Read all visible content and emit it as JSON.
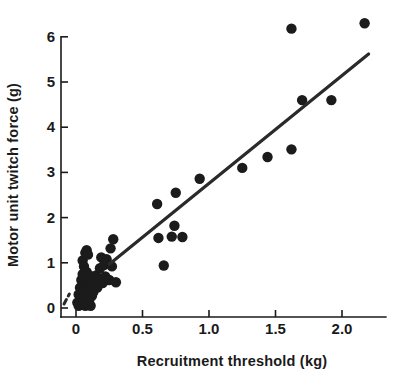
{
  "chart_data": {
    "type": "scatter",
    "title": "",
    "xlabel": "Recruitment threshold (kg)",
    "ylabel": "Motor unit twitch force (g)",
    "xlim": [
      -0.12,
      2.33
    ],
    "ylim": [
      -0.22,
      6.6
    ],
    "xticks": [
      0,
      0.5,
      1.0,
      1.5,
      2.0
    ],
    "xtick_labels": [
      "0",
      "0.5",
      "1.0",
      "1.5",
      "2.0"
    ],
    "yticks": [
      0,
      1,
      2,
      3,
      4,
      5,
      6
    ],
    "ytick_labels": [
      "0",
      "1",
      "2",
      "3",
      "4",
      "5",
      "6"
    ],
    "grid": false,
    "legend": null,
    "marker_color": "#1b1b1b",
    "marker_size": 5.2,
    "points": [
      [
        0.01,
        0.12
      ],
      [
        0.02,
        0.05
      ],
      [
        0.02,
        0.3
      ],
      [
        0.03,
        0.22
      ],
      [
        0.03,
        0.45
      ],
      [
        0.04,
        0.1
      ],
      [
        0.04,
        0.38
      ],
      [
        0.04,
        0.62
      ],
      [
        0.05,
        0.28
      ],
      [
        0.05,
        0.5
      ],
      [
        0.05,
        0.75
      ],
      [
        0.05,
        1.05
      ],
      [
        0.06,
        0.15
      ],
      [
        0.06,
        0.35
      ],
      [
        0.06,
        0.58
      ],
      [
        0.06,
        0.92
      ],
      [
        0.07,
        0.05
      ],
      [
        0.07,
        0.42
      ],
      [
        0.07,
        0.68
      ],
      [
        0.07,
        1.22
      ],
      [
        0.08,
        0.25
      ],
      [
        0.08,
        0.55
      ],
      [
        0.08,
        0.8
      ],
      [
        0.08,
        1.28
      ],
      [
        0.09,
        0.08
      ],
      [
        0.09,
        0.33
      ],
      [
        0.09,
        0.65
      ],
      [
        0.09,
        1.18
      ],
      [
        0.1,
        0.18
      ],
      [
        0.1,
        0.48
      ],
      [
        0.1,
        0.72
      ],
      [
        0.11,
        0.05
      ],
      [
        0.11,
        0.4
      ],
      [
        0.12,
        0.27
      ],
      [
        0.12,
        0.6
      ],
      [
        0.13,
        0.35
      ],
      [
        0.14,
        0.52
      ],
      [
        0.15,
        0.72
      ],
      [
        0.16,
        0.45
      ],
      [
        0.17,
        0.62
      ],
      [
        0.18,
        0.88
      ],
      [
        0.19,
        1.12
      ],
      [
        0.2,
        0.55
      ],
      [
        0.21,
        0.95
      ],
      [
        0.22,
        0.7
      ],
      [
        0.23,
        1.08
      ],
      [
        0.25,
        0.62
      ],
      [
        0.26,
        1.32
      ],
      [
        0.27,
        0.92
      ],
      [
        0.28,
        1.52
      ],
      [
        0.3,
        0.57
      ],
      [
        0.61,
        2.3
      ],
      [
        0.62,
        1.55
      ],
      [
        0.66,
        0.94
      ],
      [
        0.72,
        1.58
      ],
      [
        0.74,
        1.82
      ],
      [
        0.75,
        2.55
      ],
      [
        0.8,
        1.57
      ],
      [
        0.93,
        2.86
      ],
      [
        1.25,
        3.1
      ],
      [
        1.44,
        3.34
      ],
      [
        1.62,
        6.18
      ],
      [
        1.62,
        3.51
      ],
      [
        1.7,
        4.6
      ],
      [
        1.92,
        4.6
      ],
      [
        2.17,
        6.3
      ]
    ],
    "fit_line": {
      "style": "solid",
      "x_start": 0.25,
      "y_start": 0.97,
      "x_end": 2.2,
      "y_end": 5.62
    },
    "fit_line_dashed": {
      "style": "dashed",
      "x_start": -0.09,
      "y_start": 0.09,
      "x_end": -0.05,
      "y_end": 0.31
    }
  },
  "axes": {
    "x_title": "Recruitment threshold (kg)",
    "y_title": "Motor unit twitch force (g)"
  }
}
